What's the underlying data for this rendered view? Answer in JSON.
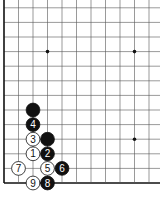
{
  "board": {
    "type": "go-diagram",
    "corner": "bottom-left",
    "origin_x": 4,
    "origin_y": 183,
    "spacing_x": 14.5,
    "spacing_y": 14.6,
    "cols": 11,
    "rows": 13,
    "line_color": "#555555",
    "edge_color": "#111111",
    "star_points": [
      [
        3,
        9
      ],
      [
        9,
        9
      ],
      [
        9,
        3
      ]
    ],
    "stones": [
      {
        "col": 2,
        "row": 5,
        "color": "black",
        "label": ""
      },
      {
        "col": 3,
        "row": 3,
        "color": "black",
        "label": ""
      },
      {
        "col": 2,
        "row": 4,
        "color": "black",
        "label": "4"
      },
      {
        "col": 2,
        "row": 3,
        "color": "white",
        "label": "3"
      },
      {
        "col": 2,
        "row": 2,
        "color": "white",
        "label": "1"
      },
      {
        "col": 3,
        "row": 2,
        "color": "black",
        "label": "2"
      },
      {
        "col": 1,
        "row": 1,
        "color": "white",
        "label": "7"
      },
      {
        "col": 3,
        "row": 1,
        "color": "white",
        "label": "5"
      },
      {
        "col": 4,
        "row": 1,
        "color": "black",
        "label": "6"
      },
      {
        "col": 2,
        "row": 0,
        "color": "white",
        "label": "9"
      },
      {
        "col": 3,
        "row": 0,
        "color": "black",
        "label": "8"
      }
    ]
  }
}
